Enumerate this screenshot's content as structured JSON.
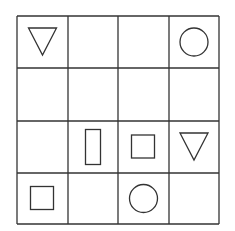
{
  "diagram": {
    "type": "grid-puzzle",
    "rows": 4,
    "cols": 4,
    "stroke_color": "#333333",
    "background": "#ffffff",
    "cells": [
      [
        "triangle-down",
        "",
        "",
        "circle"
      ],
      [
        "",
        "",
        "",
        ""
      ],
      [
        "",
        "rectangle-tall",
        "square",
        "triangle-down"
      ],
      [
        "square",
        "",
        "circle",
        ""
      ]
    ]
  }
}
